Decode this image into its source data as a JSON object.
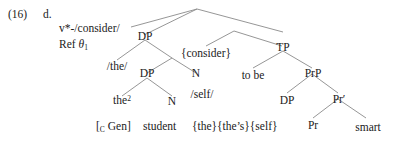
{
  "figure": {
    "example_number": "(16)",
    "example_letter": "d.",
    "type": "syntax-tree"
  },
  "head_annotation": {
    "line1": "v*-/consider/",
    "line2_prefix": "Ref ",
    "line2_theta": "θ",
    "line2_theta_sub": "1"
  },
  "nodes": {
    "dp_outer": "DP",
    "consider_copy": "{consider}",
    "tp": "TP",
    "the_phon": "/the/",
    "dp_inner": "DP",
    "n_outer": "N",
    "to_be": "to be",
    "prp": "PrP",
    "the_det": "the",
    "the_det_sup": "2",
    "n_inner": "N",
    "self_phon": "/self/",
    "dp_lower": "DP",
    "pr_bar": "Pr′",
    "pr": "Pr",
    "smart": "smart"
  },
  "terminals": {
    "gen_open": "[",
    "gen_sub": "C",
    "gen_label": " Gen]",
    "student": "student",
    "copies": "{the}{the’s}{self}"
  },
  "colors": {
    "background": "#ffffff",
    "text": "#1a1a1a",
    "line": "#8a8a8a"
  }
}
